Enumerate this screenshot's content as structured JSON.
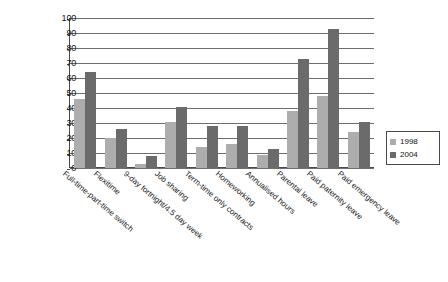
{
  "chart_data": {
    "type": "bar",
    "title": "",
    "xlabel": "",
    "ylabel": "",
    "ylim": [
      0,
      100
    ],
    "ytick_step": 10,
    "yticks": [
      "100",
      "90",
      "80",
      "70",
      "60",
      "50",
      "40",
      "30",
      "20",
      "10",
      "0"
    ],
    "grid": true,
    "legend_position": "right",
    "categories": [
      "Full-time-part-time switch",
      "Flexitime",
      "9-day fortnight/4.5 day week",
      "Job sharing",
      "Term-time only contracts",
      "Homeworking",
      "Annualised hours",
      "Parental leave",
      "Paid paternity leave",
      "Paid emergency leave"
    ],
    "series": [
      {
        "name": "1998",
        "color": "#adadad",
        "values": [
          46,
          20,
          3,
          31,
          14,
          16,
          9,
          38,
          48,
          24
        ]
      },
      {
        "name": "2004",
        "color": "#6b6b6b",
        "values": [
          64,
          26,
          8,
          41,
          28,
          28,
          13,
          73,
          93,
          31
        ]
      }
    ]
  },
  "legend": {
    "items": [
      {
        "label": "1998",
        "color": "#adadad"
      },
      {
        "label": "2004",
        "color": "#6b6b6b"
      }
    ]
  }
}
